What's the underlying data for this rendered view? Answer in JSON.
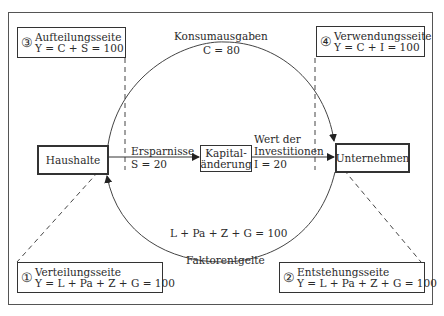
{
  "diagram": {
    "nodes": {
      "haushalte": "Haushalte",
      "unternehmen": "Unternehmen",
      "kapital_line1": "Kapital-",
      "kapital_line2": "änderung"
    },
    "flows": {
      "konsum_label": "Konsumausgaben",
      "konsum_value": "C = 80",
      "faktor_label": "Faktorentgelte",
      "faktor_value": "L + Pa + Z + G = 100",
      "sparen_label": "Ersparnisse",
      "sparen_value": "S = 20",
      "invest_label1": "Wert der",
      "invest_label2": "Investitionen",
      "invest_value": "I = 20"
    },
    "sides": [
      {
        "number": "①",
        "title": "Verteilungsseite",
        "formula": "Y = L + Pa + Z + G = 100"
      },
      {
        "number": "②",
        "title": "Entstehungsseite",
        "formula": "Y = L + Pa + Z + G = 100"
      },
      {
        "number": "③",
        "title": "Aufteilungsseite",
        "formula": "Y = C + S = 100"
      },
      {
        "number": "④",
        "title": "Verwendungsseite",
        "formula": "Y = C + I = 100"
      }
    ],
    "colors": {
      "line": "#333333",
      "text": "#2a2a2a",
      "background": "#ffffff"
    }
  }
}
